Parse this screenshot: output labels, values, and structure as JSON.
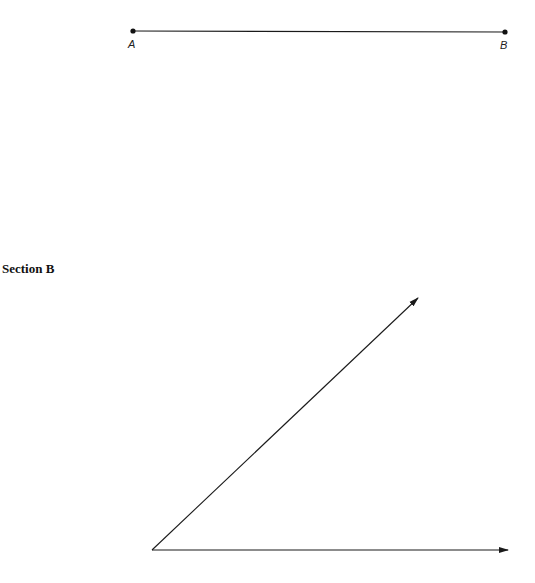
{
  "section_a": {
    "segment": {
      "start_point": {
        "label": "A",
        "x": 133,
        "y": 31
      },
      "end_point": {
        "label": "B",
        "x": 505,
        "y": 32
      }
    }
  },
  "section_b": {
    "heading": "Section B",
    "angle": {
      "vertex": {
        "x": 152,
        "y": 550
      },
      "ray_horizontal_end": {
        "x": 508,
        "y": 550
      },
      "ray_slanted_end": {
        "x": 418,
        "y": 298
      }
    }
  },
  "colors": {
    "stroke": "#1a1a1a",
    "background": "#ffffff"
  }
}
